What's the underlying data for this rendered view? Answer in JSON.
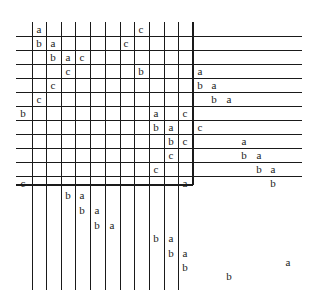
{
  "diagram": {
    "grid": {
      "left": 16,
      "top": 22,
      "col_width": 14.7,
      "row_height": 14,
      "vertical_lines_x": [
        32,
        46.5,
        61,
        75.5,
        90.5,
        105,
        120,
        134.5,
        149,
        164,
        178.5,
        193
      ],
      "bold_vertical_x": 193,
      "horizontal_lines_y": [
        36,
        50,
        64,
        78,
        92,
        106,
        120,
        134,
        148,
        162,
        176,
        185
      ],
      "bold_horizontal_y": 185,
      "vertical_top": 22,
      "vertical_bottom": 290,
      "horizontal_left": 16,
      "horizontal_right_short": 193,
      "horizontal_right_long": 302
    },
    "labels": [
      {
        "t": "a",
        "x": 34,
        "y": 24
      },
      {
        "t": "c",
        "x": 136,
        "y": 24
      },
      {
        "t": "b",
        "x": 34,
        "y": 38
      },
      {
        "t": "a",
        "x": 48,
        "y": 38
      },
      {
        "t": "c",
        "x": 121,
        "y": 38
      },
      {
        "t": "b",
        "x": 48,
        "y": 52
      },
      {
        "t": "a",
        "x": 63,
        "y": 52
      },
      {
        "t": "c",
        "x": 77,
        "y": 52
      },
      {
        "t": "c",
        "x": 63,
        "y": 66
      },
      {
        "t": "b",
        "x": 136,
        "y": 66
      },
      {
        "t": "a",
        "x": 195,
        "y": 66
      },
      {
        "t": "c",
        "x": 48,
        "y": 80
      },
      {
        "t": "b",
        "x": 195,
        "y": 80
      },
      {
        "t": "a",
        "x": 209,
        "y": 80
      },
      {
        "t": "c",
        "x": 34,
        "y": 94
      },
      {
        "t": "b",
        "x": 209,
        "y": 94
      },
      {
        "t": "a",
        "x": 224,
        "y": 94
      },
      {
        "t": "b",
        "x": 18,
        "y": 108
      },
      {
        "t": "a",
        "x": 151,
        "y": 108
      },
      {
        "t": "c",
        "x": 180,
        "y": 108
      },
      {
        "t": "b",
        "x": 151,
        "y": 122
      },
      {
        "t": "a",
        "x": 166,
        "y": 122
      },
      {
        "t": "c",
        "x": 195,
        "y": 122
      },
      {
        "t": "b",
        "x": 166,
        "y": 136
      },
      {
        "t": "c",
        "x": 180,
        "y": 136
      },
      {
        "t": "a",
        "x": 239,
        "y": 136
      },
      {
        "t": "c",
        "x": 166,
        "y": 150
      },
      {
        "t": "b",
        "x": 239,
        "y": 150
      },
      {
        "t": "a",
        "x": 254,
        "y": 150
      },
      {
        "t": "c",
        "x": 151,
        "y": 164
      },
      {
        "t": "b",
        "x": 254,
        "y": 164
      },
      {
        "t": "a",
        "x": 268,
        "y": 164
      },
      {
        "t": "c",
        "x": 18,
        "y": 178
      },
      {
        "t": "a",
        "x": 180,
        "y": 178
      },
      {
        "t": "b",
        "x": 268,
        "y": 178
      },
      {
        "t": "b",
        "x": 63,
        "y": 190
      },
      {
        "t": "a",
        "x": 77,
        "y": 190
      },
      {
        "t": "b",
        "x": 77,
        "y": 205
      },
      {
        "t": "a",
        "x": 92,
        "y": 205
      },
      {
        "t": "b",
        "x": 92,
        "y": 220
      },
      {
        "t": "a",
        "x": 107,
        "y": 220
      },
      {
        "t": "b",
        "x": 151,
        "y": 233
      },
      {
        "t": "a",
        "x": 166,
        "y": 233
      },
      {
        "t": "b",
        "x": 166,
        "y": 248
      },
      {
        "t": "a",
        "x": 180,
        "y": 248
      },
      {
        "t": "b",
        "x": 180,
        "y": 262
      },
      {
        "t": "a",
        "x": 283,
        "y": 257
      },
      {
        "t": "b",
        "x": 224,
        "y": 271
      }
    ]
  }
}
